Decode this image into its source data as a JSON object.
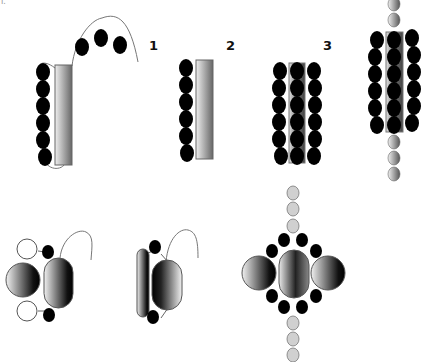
{
  "diagram": {
    "corner_mark": "I.",
    "step_labels": [
      {
        "text": "1",
        "x": 149,
        "y": 38
      },
      {
        "text": "2",
        "x": 226,
        "y": 38
      },
      {
        "text": "3",
        "x": 323,
        "y": 38
      }
    ],
    "colors": {
      "bead_black": "#000000",
      "bead_gray": "#c8c8c8",
      "rod_light": "#eeeeee",
      "rod_dark": "#6a6a6a",
      "outline": "#555555",
      "string": "#777777"
    },
    "top_row": [
      {
        "name": "stage-0-unfolded",
        "description": "rod with 6 black beads on left and strand with 3 beads looping above"
      },
      {
        "name": "stage-1",
        "description": "rod with 6 black beads on left"
      },
      {
        "name": "stage-2",
        "description": "rod flanked by two columns of 6 black beads, beads overlaid on rod"
      },
      {
        "name": "stage-3",
        "description": "full assembly with 3 bead columns and gray spheres above and below"
      }
    ],
    "bottom_row": [
      {
        "name": "side-view-a",
        "description": "sphere + oval with white and black beads"
      },
      {
        "name": "side-view-b",
        "description": "thin rod + oval with two black beads"
      },
      {
        "name": "end-view",
        "description": "three spheres ringed by 8 black beads with gray bead chain vertically"
      }
    ]
  }
}
